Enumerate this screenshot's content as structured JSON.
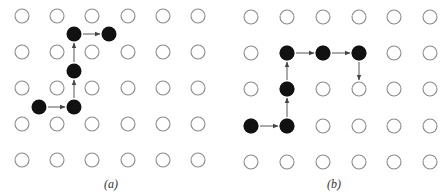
{
  "figure": {
    "panels": [
      {
        "id": "a",
        "caption": "(a)",
        "caption_pos": [
          104,
          177
        ],
        "lattice": {
          "cols": [
            22,
            57,
            92,
            128,
            163,
            198
          ],
          "rows": [
            16,
            52,
            88,
            124,
            160
          ],
          "radius": 7
        },
        "path": [
          [
            39,
            107
          ],
          [
            74,
            107
          ],
          [
            74,
            71
          ],
          [
            74,
            34
          ],
          [
            109,
            34
          ]
        ],
        "path_end_filled": true
      },
      {
        "id": "b",
        "caption": "(b)",
        "caption_pos": [
          327,
          177
        ],
        "lattice": {
          "cols": [
            251,
            287,
            323,
            359,
            394,
            430
          ],
          "rows": [
            17,
            53,
            89,
            126,
            162
          ],
          "radius": 7
        },
        "path": [
          [
            251,
            126
          ],
          [
            287,
            126
          ],
          [
            287,
            89
          ],
          [
            287,
            53
          ],
          [
            323,
            53
          ],
          [
            359,
            53
          ],
          [
            359,
            89
          ]
        ],
        "path_end_filled": false
      }
    ],
    "colors": {
      "open_circle_stroke": "#8a8a8a",
      "filled": "#111111",
      "arrow": "#444444"
    }
  }
}
